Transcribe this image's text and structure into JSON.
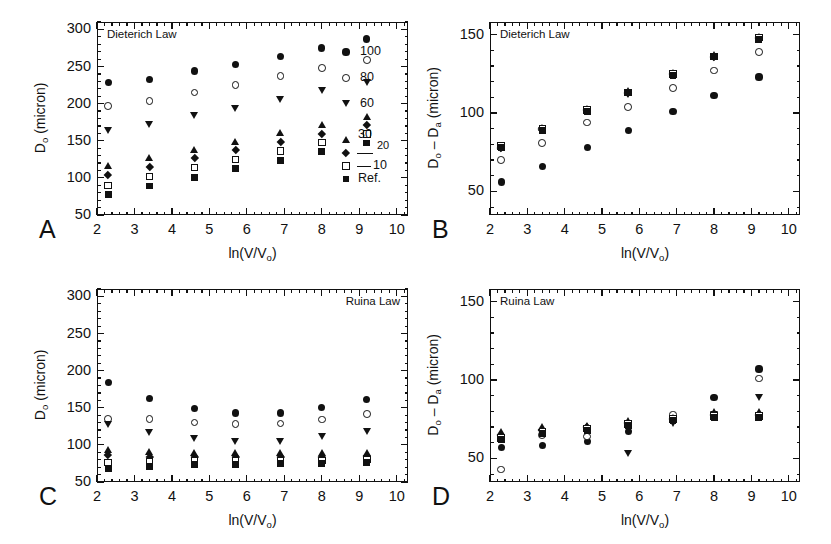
{
  "figure": {
    "xlabel": "ln(V/V",
    "xlabel_sub": "o",
    "xlabel_tail": ")"
  },
  "axes": {
    "x_ticks": [
      "2",
      "3",
      "4",
      "5",
      "6",
      "7",
      "8",
      "9",
      "10"
    ],
    "y_ticks_do": [
      "50",
      "100",
      "150",
      "200",
      "250",
      "300"
    ],
    "y_ticks_diff": [
      "50",
      "100",
      "150"
    ]
  },
  "legend": {
    "entries": [
      {
        "label": "100",
        "marker": "filled-circle"
      },
      {
        "label": "80",
        "marker": "open-circle"
      },
      {
        "label": "60",
        "marker": "filled-triangle-down"
      },
      {
        "label": "30",
        "marker": "filled-triangle-up"
      },
      {
        "label": "20",
        "marker": "none"
      },
      {
        "label": "10",
        "marker": "open-square"
      },
      {
        "label": "Ref.",
        "marker": "filled-square"
      }
    ],
    "marker_diamond": "filled-diamond"
  },
  "panels": [
    {
      "letter": "A",
      "title": "Dieterich Law",
      "title_align": "left",
      "ylabel_main": "D",
      "ylabel_sub": "o",
      "ylabel_tail": " (micron)",
      "has_legend": true
    },
    {
      "letter": "B",
      "title": "Dieterich Law",
      "title_align": "left",
      "ylabel_main": "D",
      "ylabel_sub": "o",
      "ylabel_tail": " – D",
      "ylabel_sub2": "a",
      "ylabel_tail2": " (micron)",
      "has_legend": false
    },
    {
      "letter": "C",
      "title": "Ruina Law",
      "title_align": "right",
      "ylabel_main": "D",
      "ylabel_sub": "o",
      "ylabel_tail": " (micron)",
      "has_legend": false
    },
    {
      "letter": "D",
      "title": "Ruina Law",
      "title_align": "left",
      "ylabel_main": "D",
      "ylabel_sub": "o",
      "ylabel_tail": " – D",
      "ylabel_sub2": "a",
      "ylabel_tail2": " (micron)",
      "has_legend": false
    }
  ],
  "chart_data": [
    {
      "panel": "A",
      "type": "scatter",
      "title": "Dieterich Law",
      "xlabel": "ln(V/Vo)",
      "ylabel": "Do (micron)",
      "xlim": [
        2.0,
        10.3
      ],
      "ylim": [
        50,
        310
      ],
      "xticks": [
        2,
        3,
        4,
        5,
        6,
        7,
        8,
        9,
        10
      ],
      "yticks": [
        50,
        100,
        150,
        200,
        250,
        300
      ],
      "grid": false,
      "legend_position": "inside-right",
      "x": [
        2.3,
        3.4,
        4.6,
        5.7,
        6.9,
        8.0,
        9.2
      ],
      "series": [
        {
          "name": "100",
          "marker": "filled-circle",
          "values": [
            228,
            233,
            244,
            253,
            264,
            275,
            287
          ]
        },
        {
          "name": "80",
          "marker": "open-circle",
          "values": [
            197,
            204,
            215,
            225,
            237,
            248,
            259
          ]
        },
        {
          "name": "60",
          "marker": "filled-triangle-down",
          "values": [
            164,
            172,
            184,
            194,
            205,
            217,
            229
          ]
        },
        {
          "name": "30",
          "marker": "filled-triangle-up",
          "values": [
            117,
            127,
            138,
            149,
            161,
            172,
            183
          ]
        },
        {
          "name": "20",
          "marker": "filled-diamond",
          "values": [
            104,
            115,
            127,
            138,
            149,
            160,
            171
          ]
        },
        {
          "name": "10",
          "marker": "open-square",
          "values": [
            90,
            102,
            114,
            125,
            136,
            148,
            159
          ]
        },
        {
          "name": "Ref.",
          "marker": "filled-square",
          "values": [
            78,
            89,
            101,
            113,
            124,
            136,
            147
          ]
        }
      ]
    },
    {
      "panel": "B",
      "type": "scatter",
      "title": "Dieterich Law",
      "xlabel": "ln(V/Vo)",
      "ylabel": "Do - Da (micron)",
      "xlim": [
        2.0,
        10.3
      ],
      "ylim": [
        35,
        158
      ],
      "xticks": [
        2,
        3,
        4,
        5,
        6,
        7,
        8,
        9,
        10
      ],
      "yticks": [
        50,
        100,
        150
      ],
      "grid": false,
      "legend_position": "none",
      "x": [
        2.3,
        3.4,
        4.6,
        5.7,
        6.9,
        8.0,
        9.2
      ],
      "series": [
        {
          "name": "100",
          "marker": "filled-circle",
          "values": [
            56,
            66,
            78,
            89,
            101,
            111,
            123
          ]
        },
        {
          "name": "80",
          "marker": "open-circle",
          "values": [
            70,
            81,
            94,
            104,
            116,
            127,
            139
          ]
        },
        {
          "name": "60",
          "marker": "filled-triangle-down",
          "values": [
            77,
            89,
            101,
            112,
            124,
            135,
            147
          ]
        },
        {
          "name": "30",
          "marker": "filled-triangle-up",
          "values": [
            79,
            91,
            103,
            114,
            126,
            137,
            149
          ]
        },
        {
          "name": "20",
          "marker": "filled-diamond",
          "values": [
            78,
            90,
            102,
            113,
            125,
            136,
            148
          ]
        },
        {
          "name": "10",
          "marker": "open-square",
          "values": [
            79,
            90,
            102,
            113,
            125,
            136,
            148
          ]
        },
        {
          "name": "Ref.",
          "marker": "filled-square",
          "values": [
            78,
            89,
            101,
            113,
            124,
            136,
            147
          ]
        }
      ]
    },
    {
      "panel": "C",
      "type": "scatter",
      "title": "Ruina Law",
      "xlabel": "ln(V/Vo)",
      "ylabel": "Do (micron)",
      "xlim": [
        2.0,
        10.3
      ],
      "ylim": [
        50,
        310
      ],
      "xticks": [
        2,
        3,
        4,
        5,
        6,
        7,
        8,
        9,
        10
      ],
      "yticks": [
        50,
        100,
        150,
        200,
        250,
        300
      ],
      "grid": false,
      "legend_position": "none",
      "x": [
        2.3,
        3.4,
        4.6,
        5.7,
        6.9,
        8.0,
        9.2
      ],
      "series": [
        {
          "name": "100",
          "marker": "filled-circle",
          "values": [
            184,
            163,
            149,
            143,
            143,
            150,
            161
          ]
        },
        {
          "name": "80",
          "marker": "open-circle",
          "values": [
            135,
            135,
            130,
            128,
            129,
            134,
            142
          ]
        },
        {
          "name": "60",
          "marker": "filled-triangle-down",
          "values": [
            128,
            117,
            108,
            104,
            105,
            111,
            118
          ]
        },
        {
          "name": "30",
          "marker": "filled-triangle-up",
          "values": [
            93,
            91,
            90,
            90,
            90,
            89,
            90
          ]
        },
        {
          "name": "20",
          "marker": "filled-diamond",
          "values": [
            86,
            84,
            84,
            84,
            84,
            84,
            85
          ]
        },
        {
          "name": "10",
          "marker": "open-square",
          "values": [
            76,
            77,
            78,
            79,
            79,
            79,
            80
          ]
        },
        {
          "name": "Ref.",
          "marker": "filled-square",
          "values": [
            68,
            71,
            73,
            74,
            75,
            75,
            76
          ]
        }
      ]
    },
    {
      "panel": "D",
      "type": "scatter",
      "title": "Ruina Law",
      "xlabel": "ln(V/Vo)",
      "ylabel": "Do - Da (micron)",
      "xlim": [
        2.0,
        10.3
      ],
      "ylim": [
        35,
        158
      ],
      "xticks": [
        2,
        3,
        4,
        5,
        6,
        7,
        8,
        9,
        10
      ],
      "yticks": [
        50,
        100,
        150
      ],
      "grid": false,
      "legend_position": "none",
      "x": [
        2.3,
        3.4,
        4.6,
        5.7,
        6.9,
        8.0,
        9.2
      ],
      "series": [
        {
          "name": "100",
          "marker": "filled-circle",
          "values": [
            57,
            58,
            61,
            67,
            76,
            89,
            107
          ]
        },
        {
          "name": "80",
          "marker": "open-circle",
          "values": [
            43,
            65,
            64,
            72,
            78,
            78,
            101
          ]
        },
        {
          "name": "60",
          "marker": "filled-triangle-down",
          "values": [
            63,
            66,
            68,
            53,
            72,
            78,
            89
          ]
        },
        {
          "name": "30",
          "marker": "filled-triangle-up",
          "values": [
            67,
            70,
            71,
            74,
            76,
            80,
            80
          ]
        },
        {
          "name": "20",
          "marker": "filled-diamond",
          "values": [
            65,
            68,
            70,
            73,
            75,
            78,
            78
          ]
        },
        {
          "name": "10",
          "marker": "open-square",
          "values": [
            63,
            67,
            69,
            72,
            75,
            77,
            77
          ]
        },
        {
          "name": "Ref.",
          "marker": "filled-square",
          "values": [
            62,
            66,
            68,
            71,
            74,
            76,
            76
          ]
        }
      ]
    }
  ]
}
